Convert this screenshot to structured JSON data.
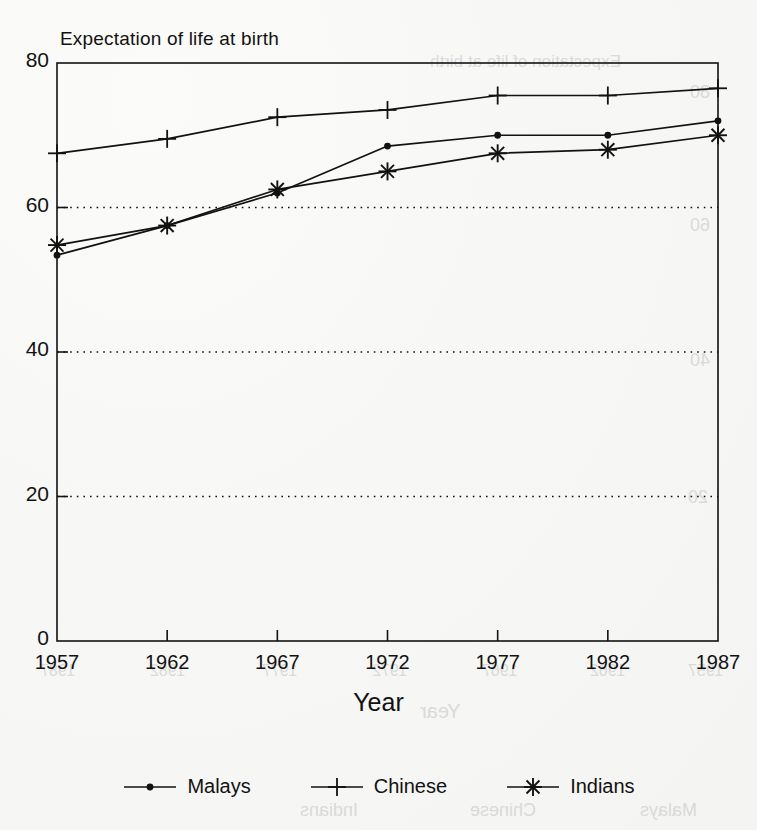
{
  "chart_data": {
    "type": "line",
    "title": "Expectation of life at birth",
    "xlabel": "Year",
    "ylabel": "",
    "categories": [
      1957,
      1962,
      1967,
      1972,
      1977,
      1982,
      1987
    ],
    "xtick_labels": [
      "1957",
      "1962",
      "1967",
      "1972",
      "1977",
      "1982",
      "1987"
    ],
    "ytick_labels": [
      "0",
      "20",
      "40",
      "60",
      "80"
    ],
    "ylim": [
      0,
      80
    ],
    "xlim": [
      1957,
      1987
    ],
    "grid": "horizontal dotted gridlines at 20, 40 and 60",
    "legend_position": "bottom-center",
    "series": [
      {
        "name": "Malays",
        "marker": "dot",
        "values": [
          53.4,
          57.5,
          62.0,
          68.5,
          70.0,
          70.0,
          72.0
        ]
      },
      {
        "name": "Chinese",
        "marker": "plus",
        "values": [
          67.5,
          69.5,
          72.5,
          73.5,
          75.5,
          75.5,
          76.5
        ]
      },
      {
        "name": "Indians",
        "marker": "asterisk",
        "values": [
          54.8,
          57.5,
          62.5,
          65.0,
          67.5,
          68.0,
          70.0
        ]
      }
    ]
  },
  "axes": {
    "y_ticks": [
      {
        "value": 80,
        "label": "80"
      },
      {
        "value": 60,
        "label": "60"
      },
      {
        "value": 40,
        "label": "40"
      },
      {
        "value": 20,
        "label": "20"
      },
      {
        "value": 0,
        "label": "0"
      }
    ],
    "x_ticks": [
      {
        "value": 1957,
        "label": "1957"
      },
      {
        "value": 1962,
        "label": "1962"
      },
      {
        "value": 1967,
        "label": "1967"
      },
      {
        "value": 1972,
        "label": "1972"
      },
      {
        "value": 1977,
        "label": "1977"
      },
      {
        "value": 1982,
        "label": "1982"
      },
      {
        "value": 1987,
        "label": "1987"
      }
    ]
  },
  "legend": {
    "entries": [
      {
        "label": "Malays",
        "marker": "dot-marker-icon"
      },
      {
        "label": "Chinese",
        "marker": "plus-marker-icon"
      },
      {
        "label": "Indians",
        "marker": "asterisk-marker-icon"
      }
    ]
  },
  "colors": {
    "ink": "#121212",
    "paper": "#f6f6f5",
    "grid": "#2b2b2b",
    "ghost": "#b9b9b7"
  },
  "bleed_through": {
    "note": "faint mirrored text showing through from the reverse of the scanned page",
    "items": [
      {
        "text": "Expectation of life at birth",
        "x": 430,
        "y": 52,
        "size": 17
      },
      {
        "text": "80",
        "x": 690,
        "y": 82,
        "size": 18
      },
      {
        "text": "60",
        "x": 690,
        "y": 215,
        "size": 18
      },
      {
        "text": "40",
        "x": 690,
        "y": 350,
        "size": 18
      },
      {
        "text": "20",
        "x": 688,
        "y": 487,
        "size": 18
      },
      {
        "text": "1987",
        "x": 40,
        "y": 662,
        "size": 16
      },
      {
        "text": "1982",
        "x": 150,
        "y": 662,
        "size": 16
      },
      {
        "text": "1977",
        "x": 262,
        "y": 662,
        "size": 16
      },
      {
        "text": "1972",
        "x": 372,
        "y": 662,
        "size": 16
      },
      {
        "text": "1967",
        "x": 482,
        "y": 662,
        "size": 16
      },
      {
        "text": "1962",
        "x": 590,
        "y": 662,
        "size": 16
      },
      {
        "text": "1957",
        "x": 688,
        "y": 662,
        "size": 16
      },
      {
        "text": "Year",
        "x": 420,
        "y": 700,
        "size": 20
      },
      {
        "text": "Indians",
        "x": 300,
        "y": 800,
        "size": 18
      },
      {
        "text": "Chinese",
        "x": 470,
        "y": 800,
        "size": 18
      },
      {
        "text": "Malays",
        "x": 640,
        "y": 800,
        "size": 18
      }
    ]
  }
}
